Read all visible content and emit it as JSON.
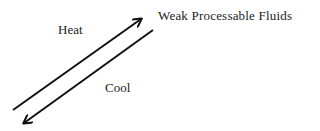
{
  "diagram": {
    "labels": {
      "heat": "Heat",
      "cool": "Cool",
      "target": "Weak Processable Fluids"
    },
    "arrows": [
      {
        "name": "heat-arrow",
        "from": [
          13,
          110
        ],
        "to": [
          142,
          18
        ],
        "direction": "up-right",
        "meaning": "Heat"
      },
      {
        "name": "cool-arrow",
        "from": [
          153,
          30
        ],
        "to": [
          23,
          124
        ],
        "direction": "down-left",
        "meaning": "Cool"
      }
    ],
    "colors": {
      "stroke": "#111111",
      "text": "#222222",
      "background": "#ffffff"
    }
  }
}
